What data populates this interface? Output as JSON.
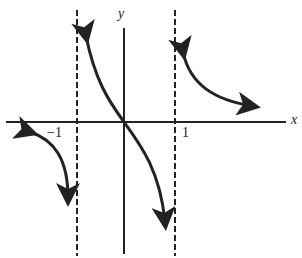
{
  "figure": {
    "x_axis_label": "x",
    "y_axis_label": "y",
    "tick_neg": "−1",
    "tick_pos": "1",
    "asymptotes": [
      "x = -1",
      "x = 1"
    ],
    "stroke_color": "#222222"
  }
}
